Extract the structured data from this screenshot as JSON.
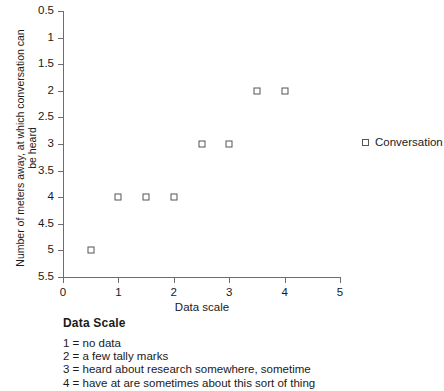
{
  "chart_data": {
    "type": "scatter",
    "title": "",
    "xlabel": "Data scale",
    "ylabel": "Number of meters away, at which conversation can be heard",
    "xlim": [
      0,
      5
    ],
    "ylim": [
      0.5,
      5.5
    ],
    "y_inverted": true,
    "grid": false,
    "legend_position": "right",
    "xticks": [
      0,
      1,
      2,
      3,
      4,
      5
    ],
    "xtick_labels": [
      "0",
      "1",
      "2",
      "3",
      "4",
      "5"
    ],
    "xticks_minor": [
      0.5,
      1.5,
      2.5,
      3.5,
      4.5
    ],
    "yticks": [
      0.5,
      1,
      1.5,
      2,
      2.5,
      3,
      3.5,
      4,
      4.5,
      5,
      5.5
    ],
    "ytick_labels": [
      "0.5",
      "1",
      "1.5",
      "2",
      "2.5",
      "3",
      "3.5",
      "4",
      "4.5",
      "5",
      "5.5"
    ],
    "series": [
      {
        "name": "Conversation",
        "marker": "open-square",
        "color": "#555555",
        "points": [
          {
            "x": 0.5,
            "y": 5
          },
          {
            "x": 1.0,
            "y": 4
          },
          {
            "x": 1.5,
            "y": 4
          },
          {
            "x": 2.0,
            "y": 4
          },
          {
            "x": 2.5,
            "y": 3
          },
          {
            "x": 3.0,
            "y": 3
          },
          {
            "x": 3.5,
            "y": 2
          },
          {
            "x": 4.0,
            "y": 2
          }
        ]
      }
    ]
  },
  "legend": {
    "entries": [
      {
        "label": "Conversation"
      }
    ]
  },
  "footnote": {
    "title": "Data Scale",
    "lines": [
      "1 = no data",
      "2 = a few tally marks",
      "3 = heard about research somewhere, sometime",
      "4 = have at are sometimes about this sort of thing"
    ]
  }
}
